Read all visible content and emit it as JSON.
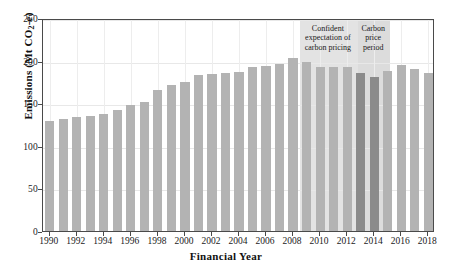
{
  "chart_data": {
    "type": "bar",
    "title": "",
    "xlabel": "Financial Year",
    "ylabel": "Emissions (Mt CO2-e)",
    "ylabel_parts": {
      "prefix": "Emissions (Mt CO",
      "sub": "2",
      "suffix": "-e)"
    },
    "ylim": [
      0,
      250
    ],
    "yticks": [
      0,
      50,
      100,
      150,
      200,
      250
    ],
    "xticks": [
      1990,
      1992,
      1994,
      1996,
      1998,
      2000,
      2002,
      2004,
      2006,
      2008,
      2010,
      2012,
      2014,
      2016,
      2018
    ],
    "grid": true,
    "legend": null,
    "categories": [
      1990,
      1991,
      1992,
      1993,
      1994,
      1995,
      1996,
      1997,
      1998,
      1999,
      2000,
      2001,
      2002,
      2003,
      2004,
      2005,
      2006,
      2007,
      2008,
      2009,
      2010,
      2011,
      2012,
      2013,
      2014,
      2015,
      2016,
      2017,
      2018
    ],
    "values": [
      129,
      131,
      134,
      135,
      137,
      142,
      148,
      152,
      165,
      171,
      175,
      183,
      184,
      186,
      187,
      192,
      194,
      196,
      203,
      198,
      193,
      192,
      193,
      185,
      181,
      188,
      195,
      190,
      185
    ],
    "bar_colors": [
      "normal",
      "normal",
      "normal",
      "normal",
      "normal",
      "normal",
      "normal",
      "normal",
      "normal",
      "normal",
      "normal",
      "normal",
      "normal",
      "normal",
      "normal",
      "normal",
      "normal",
      "normal",
      "normal",
      "normal",
      "normal",
      "normal",
      "normal",
      "dark",
      "dark",
      "normal",
      "normal",
      "normal",
      "normal"
    ],
    "annotations": [
      {
        "label": "Confident expectation of carbon pricing",
        "start_year": 2008.5,
        "end_year": 2012.8
      },
      {
        "label": "Carbon price period",
        "start_year": 2012.8,
        "end_year": 2015.2
      }
    ],
    "colors": {
      "bar_normal": "#b3b3b3",
      "bar_dark": "#8b8b8b",
      "band_1": "#e3e3e3",
      "band_2": "#dcdcdc",
      "axis": "#4a4a4a",
      "grid": "#e8e8e8",
      "text": "#1a1a1a"
    }
  }
}
